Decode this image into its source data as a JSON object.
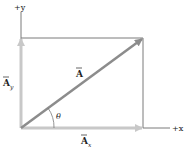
{
  "diagram": {
    "axes": {
      "y_label": "+y",
      "x_label": "+x"
    },
    "vectors": {
      "A": {
        "symbol": "A",
        "has_arrow_over": true
      },
      "Ax": {
        "symbol": "A",
        "subscript": "x",
        "has_arrow_over": true
      },
      "Ay": {
        "symbol": "A",
        "subscript": "y",
        "has_arrow_over": true
      }
    },
    "angle_label": "θ",
    "colors": {
      "axis": "#7a7a7a",
      "vector": "#8c8c8c",
      "component": "#c8c8c8",
      "text": "#222222"
    }
  }
}
